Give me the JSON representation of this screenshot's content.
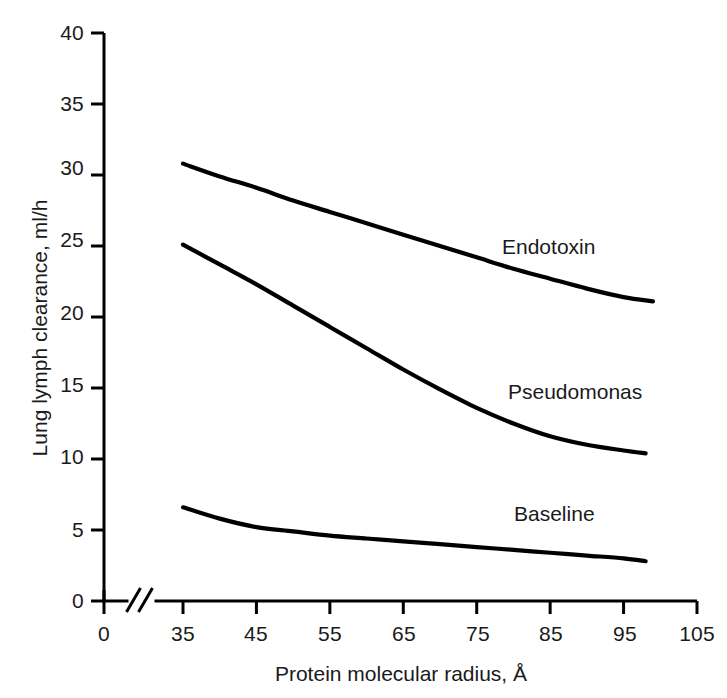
{
  "chart_data": {
    "type": "line",
    "title": "",
    "xlabel": "Protein molecular radius, Å",
    "ylabel": "Lung lymph clearance, ml/h",
    "xlim": [
      0,
      105
    ],
    "ylim": [
      0,
      40
    ],
    "grid": false,
    "legend_position": "inline-labels",
    "axis_break": {
      "axis": "x",
      "symbol": "//",
      "between": [
        0,
        35
      ]
    },
    "xticks": [
      0,
      35,
      45,
      55,
      65,
      75,
      85,
      95,
      105
    ],
    "xtick_labels": [
      "0",
      "35",
      "45",
      "55",
      "65",
      "75",
      "85",
      "95",
      "105"
    ],
    "yticks": [
      0,
      5,
      10,
      15,
      20,
      25,
      30,
      35,
      40
    ],
    "ytick_labels": [
      "0",
      "5",
      "10",
      "15",
      "20",
      "25",
      "30",
      "35",
      "40"
    ],
    "series": [
      {
        "name": "Endotoxin",
        "color": "#000000",
        "x": [
          35,
          40,
          45,
          50,
          55,
          60,
          65,
          70,
          75,
          80,
          85,
          90,
          95,
          99
        ],
        "values": [
          30.8,
          29.9,
          29.1,
          28.2,
          27.4,
          26.6,
          25.8,
          25.0,
          24.2,
          23.4,
          22.7,
          22.0,
          21.4,
          21.1
        ],
        "label_text": "Endotoxin"
      },
      {
        "name": "Pseudomonas",
        "color": "#000000",
        "x": [
          35,
          40,
          45,
          50,
          55,
          60,
          65,
          70,
          75,
          80,
          85,
          90,
          95,
          98
        ],
        "values": [
          25.1,
          23.7,
          22.3,
          20.8,
          19.3,
          17.8,
          16.3,
          14.9,
          13.6,
          12.5,
          11.6,
          11.0,
          10.6,
          10.4
        ],
        "label_text": "Pseudomonas"
      },
      {
        "name": "Baseline",
        "color": "#000000",
        "x": [
          35,
          40,
          45,
          50,
          55,
          60,
          65,
          70,
          75,
          80,
          85,
          90,
          95,
          98
        ],
        "values": [
          6.6,
          5.8,
          5.2,
          4.9,
          4.6,
          4.4,
          4.2,
          4.0,
          3.8,
          3.6,
          3.4,
          3.2,
          3.0,
          2.8
        ],
        "label_text": "Baseline"
      }
    ]
  },
  "axes": {
    "y_title": "Lung lymph clearance, ml/h",
    "x_title": "Protein molecular radius, Å"
  },
  "ytick_0": "0",
  "ytick_1": "5",
  "ytick_2": "10",
  "ytick_3": "15",
  "ytick_4": "20",
  "ytick_5": "25",
  "ytick_6": "30",
  "ytick_7": "35",
  "ytick_8": "40",
  "xtick_0": "0",
  "xtick_1": "35",
  "xtick_2": "45",
  "xtick_3": "55",
  "xtick_4": "65",
  "xtick_5": "75",
  "xtick_6": "85",
  "xtick_7": "95",
  "xtick_8": "105",
  "label_endotoxin": "Endotoxin",
  "label_pseudomonas": "Pseudomonas",
  "label_baseline": "Baseline"
}
